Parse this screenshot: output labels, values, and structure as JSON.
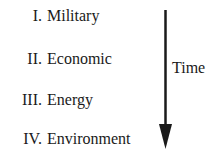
{
  "diagram": {
    "items": [
      {
        "numeral": "I.",
        "label": "Military"
      },
      {
        "numeral": "II.",
        "label": "Economic"
      },
      {
        "numeral": "III.",
        "label": "Energy"
      },
      {
        "numeral": "IV.",
        "label": "Environment"
      }
    ],
    "arrow_label": "Time",
    "arrow_direction": "down",
    "color": "#1a1a1a"
  }
}
